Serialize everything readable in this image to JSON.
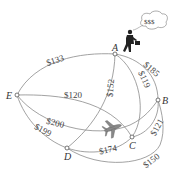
{
  "diagram": {
    "type": "weighted-graph",
    "nodes": [
      {
        "id": "A",
        "label": "A",
        "x": 115,
        "y": 54
      },
      {
        "id": "B",
        "label": "B",
        "x": 158,
        "y": 100
      },
      {
        "id": "C",
        "label": "C",
        "x": 132,
        "y": 137
      },
      {
        "id": "D",
        "label": "D",
        "x": 67,
        "y": 148
      },
      {
        "id": "E",
        "label": "E",
        "x": 17,
        "y": 95
      }
    ],
    "edges": [
      {
        "from": "A",
        "to": "E",
        "label": "$133"
      },
      {
        "from": "A",
        "to": "D",
        "label": "$152"
      },
      {
        "from": "A",
        "to": "C",
        "label": "$119"
      },
      {
        "from": "A",
        "to": "B",
        "label": "$185"
      },
      {
        "from": "E",
        "to": "C",
        "label": "$120"
      },
      {
        "from": "E",
        "to": "B",
        "label": "$200"
      },
      {
        "from": "E",
        "to": "D",
        "label": "$199"
      },
      {
        "from": "D",
        "to": "C",
        "label": "$174"
      },
      {
        "from": "C",
        "to": "B",
        "label": "$121"
      },
      {
        "from": "D",
        "to": "B",
        "label": "$150"
      }
    ],
    "thought_bubble": "$$$",
    "icons": [
      "businessman-icon",
      "airplane-icon",
      "thought-bubble-icon"
    ]
  }
}
